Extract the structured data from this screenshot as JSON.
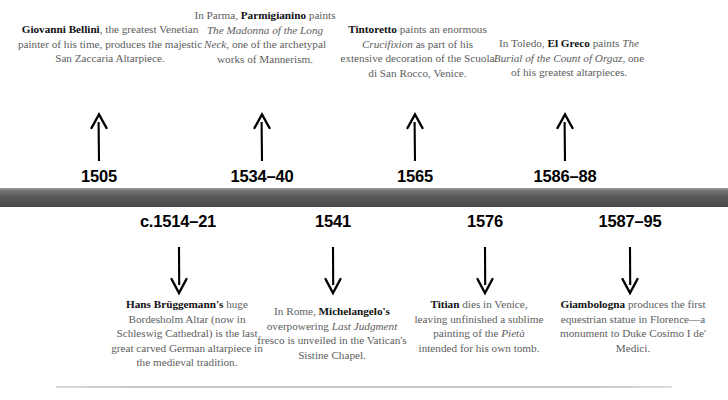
{
  "timeline": {
    "bar_color": "#565656",
    "rule_color": "#c9c9c9",
    "text_color": "#5d5d5d",
    "bold_color": "#111111"
  },
  "above": [
    {
      "date": "1505",
      "arrow": "arrow-up-icon",
      "text_html": "<b>Giovanni Bellini</b>, the greatest Venetian painter of his time, produces the majestic San Zaccaria Altarpiece.",
      "plain": "Giovanni Bellini, the greatest Venetian painter of his time, produces the majestic San Zaccaria Altarpiece."
    },
    {
      "date": "1534–40",
      "arrow": "arrow-up-icon",
      "text_html": "In Parma, <b>Parmigianino</b> paints <i>The Madonna of the Long Neck</i>, one of the archetypal works of Mannerism.",
      "plain": "In Parma, Parmigianino paints The Madonna of the Long Neck, one of the archetypal works of Mannerism."
    },
    {
      "date": "1565",
      "arrow": "arrow-up-icon",
      "text_html": "<b>Tintoretto</b> paints an enormous <i>Crucifixion</i> as part of his extensive decoration of the Scuola di San Rocco, Venice.",
      "plain": "Tintoretto paints an enormous Crucifixion as part of his extensive decoration of the Scuola di San Rocco, Venice."
    },
    {
      "date": "1586–88",
      "arrow": "arrow-up-icon",
      "text_html": "In Toledo, <b>El Greco</b> paints <i>The Burial of the Count of Orgaz</i>, one of his greatest altarpieces.",
      "plain": "In Toledo, El Greco paints The Burial of the Count of Orgaz, one of his greatest altarpieces."
    }
  ],
  "below": [
    {
      "date": "c.1514–21",
      "arrow": "arrow-down-icon",
      "text_html": "<b>Hans Brüggemann's</b> huge Bordesholm Altar (now in Schleswig Cathedral) is the last great carved German altarpiece in the medieval tradition.",
      "plain": "Hans Brüggemann's huge Bordesholm Altar (now in Schleswig Cathedral) is the last great carved German altarpiece in the medieval tradition."
    },
    {
      "date": "1541",
      "arrow": "arrow-down-icon",
      "text_html": "In Rome, <b>Michelangelo's</b> overpowering <i>Last Judgment</i> fresco is unveiled in the Vatican's Sistine Chapel.",
      "plain": "In Rome, Michelangelo's overpowering Last Judgment fresco is unveiled in the Vatican's Sistine Chapel."
    },
    {
      "date": "1576",
      "arrow": "arrow-down-icon",
      "text_html": "<b>Titian</b> dies in Venice, leaving unfinished a sublime painting of the <i>Pietà</i> intended for his own tomb.",
      "plain": "Titian dies in Venice, leaving unfinished a sublime painting of the Pietà intended for his own tomb."
    },
    {
      "date": "1587–95",
      "arrow": "arrow-down-icon",
      "text_html": "<b>Giambologna</b> produces the first equestrian statue in Florence—a monument to Duke Cosimo I de' Medici.",
      "plain": "Giambologna produces the first equestrian statue in Florence—a monument to Duke Cosimo I de' Medici."
    }
  ]
}
